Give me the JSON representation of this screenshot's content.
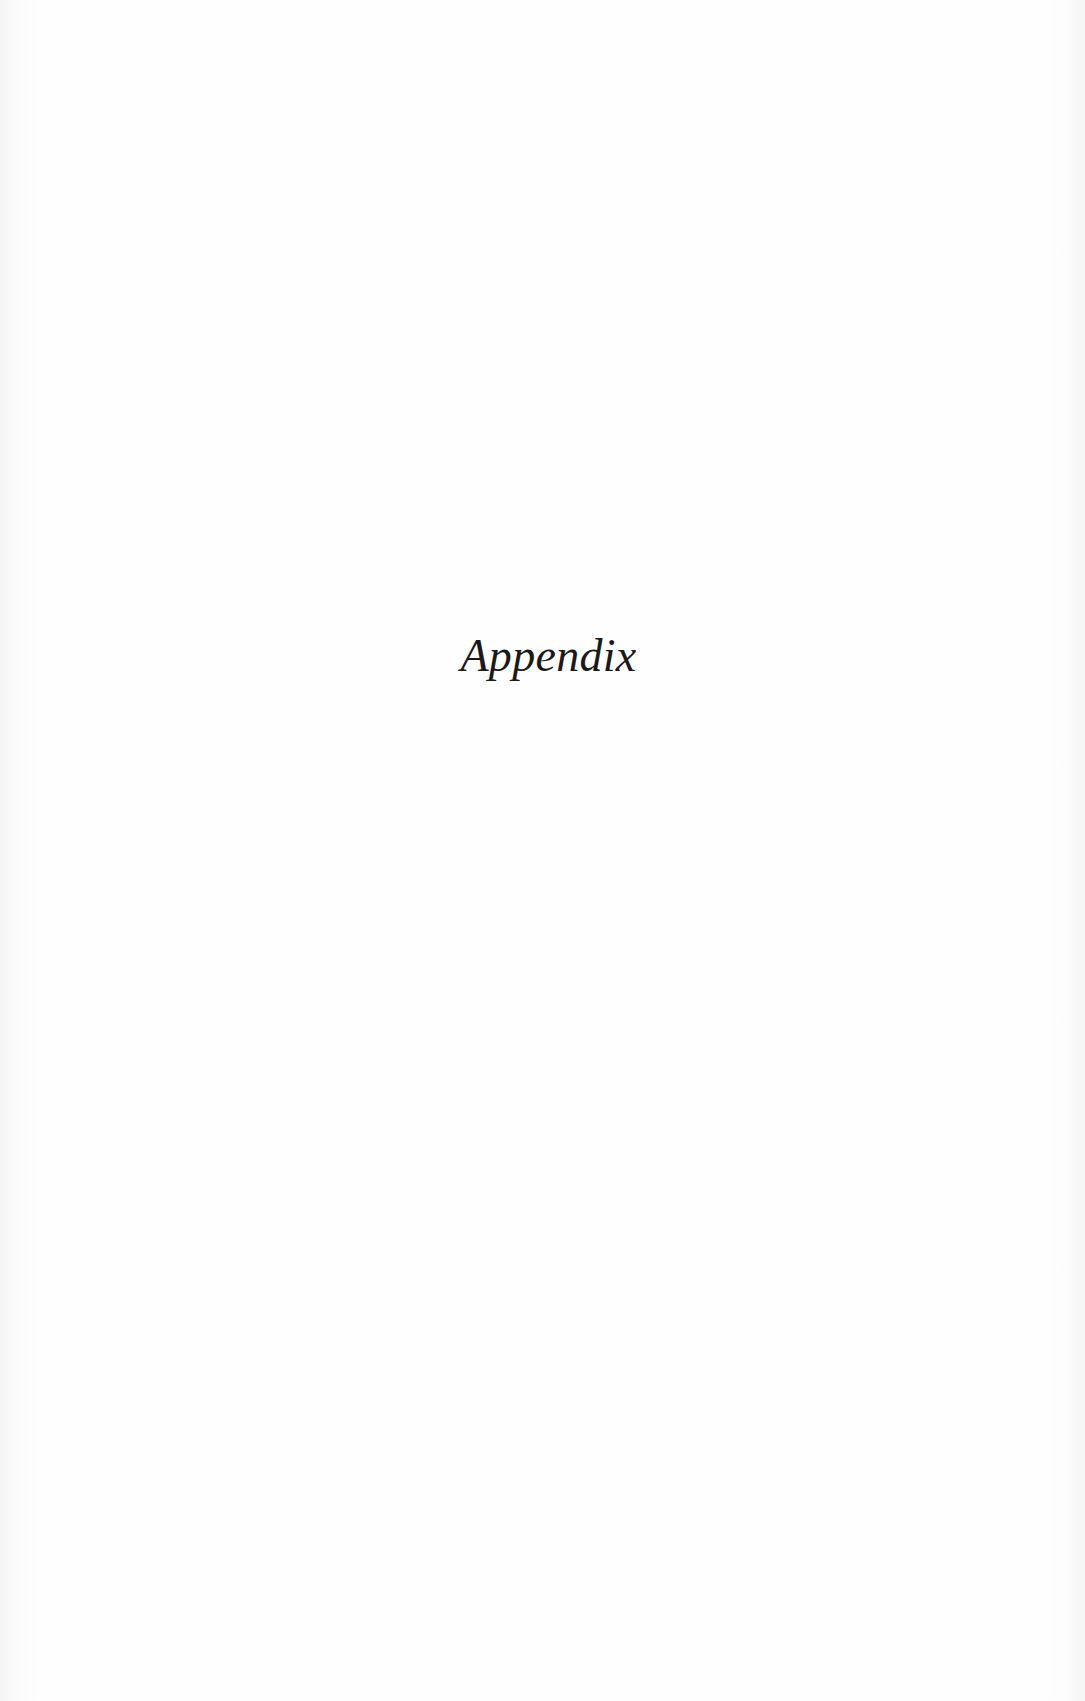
{
  "page": {
    "title": "Appendix"
  }
}
